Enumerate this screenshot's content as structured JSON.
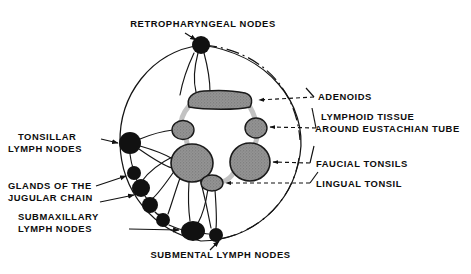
{
  "figure": {
    "title_text": "Waldeyer's lymphatic ring and cervical lymph nodes",
    "background_color": "#ffffff",
    "ink_color": "#111111",
    "node_fill_color": "#111111",
    "tonsil_fill_color": "#8d8d8d",
    "ring_band_color": "#c2c2c2",
    "tonsil_outline_color": "#1a1a1a"
  },
  "labels": {
    "retropharyngeal": "RETROPHARYNGEAL NODES",
    "adenoids": "ADENOIDS",
    "eustachian_line1": "LYMPHOID TISSUE",
    "eustachian_line2": "AROUND EUSTACHIAN TUBE",
    "faucial": "FAUCIAL TONSILS",
    "lingual": "LINGUAL TONSIL",
    "tonsillar_line1": "TONSILLAR",
    "tonsillar_line2": "LYMPH NODES",
    "jugular_line1": "GLANDS OF THE",
    "jugular_line2": "JUGULAR CHAIN",
    "submaxillary_line1": "SUBMAXILLARY",
    "submaxillary_line2": "LYMPH NODES",
    "submental": "SUBMENTAL LYMPH NODES"
  },
  "structures": {
    "adenoid_pad": {
      "name": "adenoids",
      "cx": 219,
      "cy": 100,
      "rx": 32,
      "ry": 9
    },
    "eustachian_left": {
      "name": "lymphoid-tissue-eustachian-left",
      "cx": 183,
      "cy": 130,
      "rx": 11,
      "ry": 9
    },
    "eustachian_right": {
      "name": "lymphoid-tissue-eustachian-right",
      "cx": 256,
      "cy": 128,
      "rx": 11,
      "ry": 10
    },
    "faucial_left": {
      "name": "faucial-tonsil-left",
      "cx": 192,
      "cy": 163,
      "rx": 21,
      "ry": 19
    },
    "faucial_right": {
      "name": "faucial-tonsil-right",
      "cx": 250,
      "cy": 162,
      "rx": 20,
      "ry": 19
    },
    "lingual": {
      "name": "lingual-tonsil",
      "cx": 212,
      "cy": 183,
      "rx": 11,
      "ry": 8
    }
  },
  "lymph_nodes": [
    {
      "name": "retropharyngeal-node",
      "cx": 201,
      "cy": 45,
      "r": 9
    },
    {
      "name": "tonsillar-node",
      "cx": 130,
      "cy": 143,
      "r": 11
    },
    {
      "name": "jugular-node-1",
      "cx": 134,
      "cy": 173,
      "r": 7
    },
    {
      "name": "jugular-node-2",
      "cx": 141,
      "cy": 188,
      "r": 9
    },
    {
      "name": "jugular-node-3",
      "cx": 150,
      "cy": 205,
      "r": 8
    },
    {
      "name": "jugular-node-4",
      "cx": 163,
      "cy": 220,
      "r": 7
    },
    {
      "name": "submaxillary-node",
      "cx": 193,
      "cy": 231,
      "r": 11
    },
    {
      "name": "submental-node",
      "cx": 216,
      "cy": 235,
      "r": 7
    }
  ],
  "leader_lines": {
    "adenoids_dashed": true,
    "eustachian_dashed": true,
    "faucial_dashed": true,
    "lingual_dashed": true,
    "tonsillar_arrow": true,
    "submaxillary_arrow": true,
    "submental_arrow": true
  }
}
